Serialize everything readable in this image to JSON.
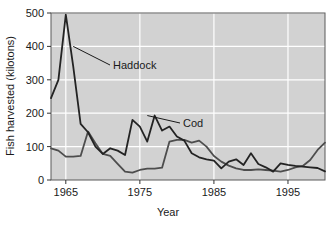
{
  "chart_data": {
    "type": "line",
    "title": "",
    "xlabel": "Year",
    "ylabel": "Fish harvested (kilotons)",
    "xlim": [
      1963,
      2000
    ],
    "ylim": [
      0,
      500
    ],
    "xticks": [
      1965,
      1975,
      1985,
      1995
    ],
    "yticks": [
      0,
      100,
      200,
      300,
      400,
      500
    ],
    "grid": true,
    "legend_position": "inline-annotation",
    "background_color": "#d2d2d2",
    "gridline_color": "#ffffff",
    "annotations": [
      {
        "text": "Haddock",
        "series": "Haddock",
        "point_year": 1966,
        "point_value": 400
      },
      {
        "text": "Cod",
        "series": "Cod",
        "point_year": 1976,
        "point_value": 193
      }
    ],
    "series": [
      {
        "name": "Haddock",
        "color": "#4d4d4d",
        "x": [
          1963,
          1964,
          1965,
          1966,
          1967,
          1968,
          1969,
          1970,
          1971,
          1972,
          1973,
          1974,
          1975,
          1976,
          1977,
          1978,
          1979,
          1980,
          1981,
          1982,
          1983,
          1984,
          1985,
          1986,
          1987,
          1988,
          1989,
          1990,
          1991,
          1992,
          1993,
          1994,
          1995,
          1996,
          1997,
          1998,
          1999,
          2000
        ],
        "values": [
          95,
          88,
          70,
          70,
          72,
          145,
          110,
          78,
          72,
          48,
          25,
          22,
          30,
          34,
          34,
          37,
          115,
          120,
          120,
          112,
          118,
          100,
          72,
          55,
          43,
          35,
          30,
          30,
          32,
          30,
          28,
          25,
          30,
          38,
          42,
          60,
          90,
          112
        ]
      },
      {
        "name": "Cod",
        "color": "#232323",
        "x": [
          1963,
          1964,
          1965,
          1966,
          1967,
          1968,
          1969,
          1970,
          1971,
          1972,
          1973,
          1974,
          1975,
          1976,
          1977,
          1978,
          1979,
          1980,
          1981,
          1982,
          1983,
          1984,
          1985,
          1986,
          1987,
          1988,
          1989,
          1990,
          1991,
          1992,
          1993,
          1994,
          1995,
          1996,
          1997,
          1998,
          1999,
          2000
        ],
        "values": [
          245,
          300,
          495,
          340,
          168,
          143,
          100,
          78,
          95,
          88,
          75,
          180,
          160,
          115,
          193,
          148,
          160,
          130,
          118,
          80,
          68,
          62,
          58,
          35,
          55,
          62,
          45,
          80,
          48,
          38,
          25,
          50,
          45,
          42,
          40,
          38,
          36,
          26
        ]
      }
    ]
  },
  "axes": {
    "y_tick_labels": [
      "500",
      "400",
      "300",
      "200",
      "100",
      "0"
    ],
    "x_tick_labels": [
      "1965",
      "1975",
      "1985",
      "1995"
    ],
    "y_axis_title": "Fish harvested (kilotons)",
    "x_axis_title": "Year"
  },
  "labels": {
    "haddock": "Haddock",
    "cod": "Cod"
  }
}
